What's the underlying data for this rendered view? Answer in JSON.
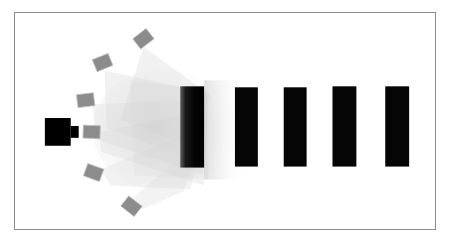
{
  "diagram": {
    "canvas": {
      "width": 453,
      "height": 241,
      "background": "#ffffff"
    },
    "frame": {
      "label": "diagram-frame",
      "x": 14,
      "y": 12,
      "width": 422,
      "height": 218,
      "stroke": "#8d8d8d",
      "stroke_width": 1.5,
      "fill": "#ffffff"
    },
    "colors": {
      "source_black": "#000000",
      "sensor_gray": "#8c8c8c",
      "sensor_stroke": "#b9b9b9",
      "bar_black": "#050505",
      "beam_gray": "#cfcfcf",
      "frame_gray": "#8d8d8d",
      "background": "#ffffff"
    },
    "source": {
      "label": "light-source",
      "body": {
        "x": 44,
        "y": 118,
        "width": 26,
        "height": 28
      },
      "nozzle": {
        "x": 70,
        "y": 126,
        "width": 8,
        "height": 12
      },
      "color": "#000000"
    },
    "sensors": [
      {
        "id": "sensor-1",
        "cx": 143,
        "cy": 38,
        "width": 17,
        "height": 13,
        "rotation": -38
      },
      {
        "id": "sensor-2",
        "cx": 102,
        "cy": 62,
        "width": 17,
        "height": 13,
        "rotation": -22
      },
      {
        "id": "sensor-3",
        "cx": 85,
        "cy": 100,
        "width": 17,
        "height": 13,
        "rotation": -7
      },
      {
        "id": "sensor-4",
        "cx": 91,
        "cy": 132,
        "width": 17,
        "height": 13,
        "rotation": 2
      },
      {
        "id": "sensor-5",
        "cx": 93,
        "cy": 173,
        "width": 17,
        "height": 13,
        "rotation": 20
      },
      {
        "id": "sensor-6",
        "cx": 131,
        "cy": 207,
        "width": 17,
        "height": 13,
        "rotation": 38
      }
    ],
    "beams": [
      {
        "id": "beam-1",
        "from_sensor": "sensor-1",
        "opacity": 0.3,
        "points": "143,46 210,95 200,150 120,120"
      },
      {
        "id": "beam-2",
        "from_sensor": "sensor-2",
        "opacity": 0.3,
        "points": "104,70 205,92 198,162 106,128"
      },
      {
        "id": "beam-3",
        "from_sensor": "sensor-3",
        "opacity": 0.28,
        "points": "92,104 206,100 202,175 96,140"
      },
      {
        "id": "beam-4",
        "from_sensor": "sensor-4",
        "opacity": 0.28,
        "points": "99,132 208,110 204,186 100,152"
      },
      {
        "id": "beam-5",
        "from_sensor": "sensor-5",
        "opacity": 0.28,
        "points": "100,170 206,125 190,190 110,186"
      },
      {
        "id": "beam-6",
        "from_sensor": "sensor-6",
        "opacity": 0.26,
        "points": "132,199 200,140 184,192 142,210"
      },
      {
        "id": "beam-core",
        "from_sensor": "core",
        "opacity": 0.22,
        "points": "130,80 208,90 208,180 134,176"
      }
    ],
    "bars": [
      {
        "id": "bar-1",
        "label": "bar-1",
        "x": 180,
        "y": 86,
        "width": 24,
        "height": 82,
        "gradient": true
      },
      {
        "id": "bar-2",
        "label": "bar-2",
        "x": 235,
        "y": 87,
        "width": 23,
        "height": 80,
        "gradient": false
      },
      {
        "id": "bar-3",
        "label": "bar-3",
        "x": 284,
        "y": 87,
        "width": 23,
        "height": 80,
        "gradient": false
      },
      {
        "id": "bar-4",
        "label": "bar-4",
        "x": 333,
        "y": 86,
        "width": 24,
        "height": 81,
        "gradient": false
      },
      {
        "id": "bar-5",
        "label": "bar-5",
        "x": 386,
        "y": 86,
        "width": 24,
        "height": 81,
        "gradient": false
      }
    ],
    "glow": {
      "label": "right-haze",
      "x": 204,
      "y": 80,
      "width": 40,
      "height": 100,
      "opacity": 0.25
    }
  }
}
